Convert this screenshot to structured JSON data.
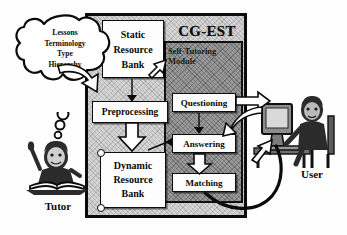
{
  "diagram": {
    "title": "CG-EST",
    "frame_label": "CG-EST",
    "module": {
      "label_line1": "Self-Tutoring",
      "label_line2": "Module"
    },
    "cloud": {
      "name": "knowledge-cloud",
      "lines": [
        "Lessons",
        "Terminology",
        "Type",
        "Hierarchy"
      ]
    },
    "actors": {
      "tutor": "Tutor",
      "user": "User"
    },
    "boxes": {
      "static_bank": {
        "line1": "Static",
        "line2": "Resource",
        "line3": "Bank"
      },
      "preprocessing": {
        "line1": "Preprocessing"
      },
      "dynamic_bank": {
        "line1": "Dynamic",
        "line2": "Resource",
        "line3": "Bank"
      },
      "questioning": {
        "line1": "Questioning"
      },
      "answering": {
        "line1": "Answering"
      },
      "matching": {
        "line1": "Matching"
      }
    },
    "colors": {
      "frame_fill": "#d6d6d6",
      "module_fill": "#9a9a9a",
      "box_fill": "#fdfdfd",
      "ink": "#0b0b0b",
      "page": "#ffffff"
    },
    "edges": [
      {
        "from": "knowledge-cloud",
        "to": "preprocessing",
        "style": "hollow-curved-arrow"
      },
      {
        "from": "static_bank",
        "to": "preprocessing",
        "style": "solid-arrow-down"
      },
      {
        "from": "static_bank",
        "to": "self-tutoring-module",
        "style": "hollow-arrow"
      },
      {
        "from": "preprocessing",
        "to": "dynamic_bank",
        "style": "hollow-arrow-down"
      },
      {
        "from": "dynamic_bank",
        "to": "answering",
        "style": "thin-arrow"
      },
      {
        "from": "questioning",
        "to": "answering",
        "style": "solid-arrow-down"
      },
      {
        "from": "answering",
        "to": "matching",
        "style": "hollow-arrow-down"
      },
      {
        "from": "questioning",
        "to": "user",
        "style": "hollow-block-arrow-right"
      },
      {
        "from": "user",
        "to": "answering",
        "style": "hollow-block-arrow-left"
      },
      {
        "from": "matching",
        "to": "user",
        "style": "thick-curved-line"
      }
    ]
  }
}
